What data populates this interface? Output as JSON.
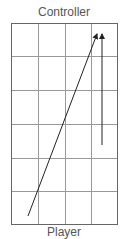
{
  "diagram": {
    "top_label": "Controller",
    "bottom_label": "Player",
    "grid": {
      "x": 11,
      "y": 23,
      "width": 107,
      "height": 202,
      "cols": 4,
      "rows": 6,
      "line_color": "#888888",
      "border_color": "#555555"
    },
    "arrows": [
      {
        "name": "diagonal-arrow",
        "x1": 28,
        "y1": 216,
        "x2": 97,
        "y2": 34,
        "color": "#222222"
      },
      {
        "name": "vertical-arrow",
        "x1": 102,
        "y1": 145,
        "x2": 102,
        "y2": 34,
        "color": "#222222"
      }
    ]
  }
}
